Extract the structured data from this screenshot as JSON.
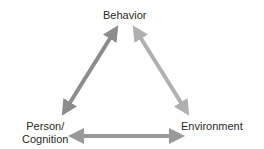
{
  "nodes": {
    "behavior": "Behavior",
    "person_line1": "Person/",
    "person_line2": "Cognition",
    "environment": "Environment"
  },
  "arrows": [
    {
      "from": "Behavior",
      "to": "Person/Cognition",
      "bidirectional": true,
      "color": "#8c8c8c"
    },
    {
      "from": "Behavior",
      "to": "Environment",
      "bidirectional": true,
      "color": "#b0b0b0"
    },
    {
      "from": "Person/Cognition",
      "to": "Environment",
      "bidirectional": true,
      "color": "#999999"
    }
  ]
}
